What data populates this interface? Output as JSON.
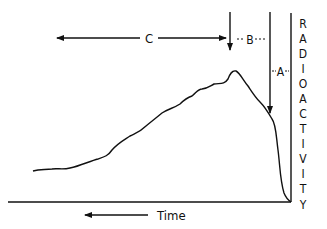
{
  "diagram": {
    "type": "radioactivity-time-curve",
    "colors": {
      "ink": "#111111",
      "background": "#ffffff"
    },
    "labels": {
      "segment_c": "C",
      "segment_b": "B",
      "segment_a": "A",
      "y_axis": "RADIOACTIVITY",
      "x_axis": "Time"
    },
    "y_axis_letters": [
      "R",
      "A",
      "D",
      "I",
      "O",
      "A",
      "C",
      "T",
      "I",
      "V",
      "I",
      "T",
      "Y"
    ]
  }
}
